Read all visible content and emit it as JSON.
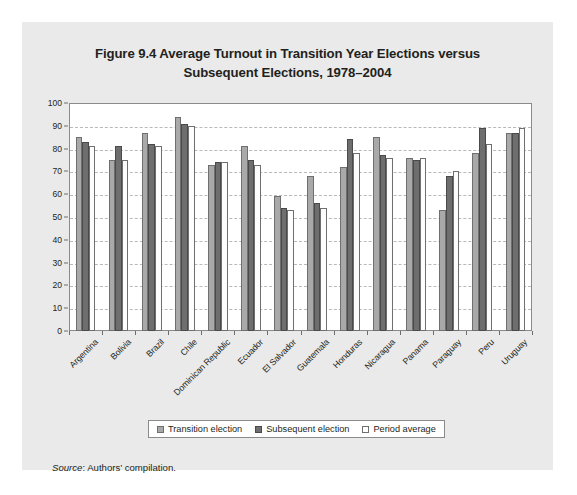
{
  "figure": {
    "title": "Figure 9.4 Average Turnout in Transition Year Elections versus Subsequent Elections, 1978–2004",
    "title_line1": "Figure 9.4 Average Turnout in Transition Year Elections versus",
    "title_line2": "Subsequent Elections, 1978–2004",
    "source_label": "Source",
    "source_text": ": Authors’ compilation.",
    "panel_bg": "#eaeaea",
    "plot_bg": "#ffffff"
  },
  "legend": {
    "position": "bottom-center",
    "entries": [
      {
        "label": "Transition election",
        "color": "#a9a9a9"
      },
      {
        "label": "Subsequent election",
        "color": "#6e6e6e"
      },
      {
        "label": "Period average",
        "color": "#ffffff"
      }
    ]
  },
  "chart_data": {
    "type": "bar",
    "title": "Figure 9.4 Average Turnout in Transition Year Elections versus Subsequent Elections, 1978–2004",
    "xlabel": "",
    "ylabel": "",
    "ylim": [
      0,
      100
    ],
    "yticks": [
      0,
      10,
      20,
      30,
      40,
      50,
      60,
      70,
      80,
      90,
      100
    ],
    "ytick_labels": [
      "0",
      "10",
      "20",
      "30",
      "40",
      "50",
      "60",
      "70",
      "80",
      "90",
      "100"
    ],
    "grid": true,
    "grid_axis": "y",
    "grid_style": "dashed",
    "legend_position": "bottom",
    "categories": [
      "Argentina",
      "Bolivia",
      "Brazil",
      "Chile",
      "Dominican Republic",
      "Ecuador",
      "El Salvador",
      "Guatemala",
      "Honduras",
      "Nicaragua",
      "Panama",
      "Paraguay",
      "Peru",
      "Uruguay"
    ],
    "series": [
      {
        "name": "Transition election",
        "color": "#a9a9a9",
        "values": [
          85,
          75,
          87,
          94,
          73,
          81,
          59,
          68,
          72,
          85,
          76,
          53,
          78,
          87
        ]
      },
      {
        "name": "Subsequent election",
        "color": "#6e6e6e",
        "values": [
          83,
          81,
          82,
          91,
          74,
          75,
          54,
          56,
          84,
          77,
          75,
          68,
          89,
          87
        ]
      },
      {
        "name": "Period average",
        "color": "#ffffff",
        "values": [
          81,
          75,
          81,
          90,
          74,
          73,
          53,
          54,
          78,
          76,
          76,
          70,
          82,
          89
        ]
      }
    ]
  }
}
